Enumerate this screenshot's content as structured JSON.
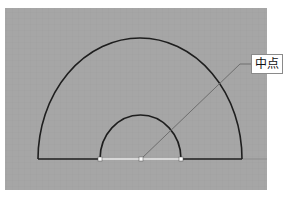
{
  "viewport": {
    "background": "#a6a6a6",
    "grid_color": "#9c9c9c",
    "left": 5,
    "top": 8,
    "right": 267,
    "bottom": 190
  },
  "shapes": {
    "outer_arc": {
      "cx": 140,
      "cy": 159,
      "rx": 102,
      "ry": 121,
      "color": "#1e1e1e"
    },
    "inner_arc": {
      "cx": 140.5,
      "cy": 159,
      "rx": 40.5,
      "ry": 44,
      "color": "#1e1e1e"
    },
    "baseline_left": {
      "x1": 38,
      "x2": 100,
      "y": 159
    },
    "baseline_right": {
      "x1": 181,
      "x2": 242,
      "y": 159
    },
    "highlighted_segment": {
      "x1": 100,
      "x2": 181,
      "y": 159,
      "color": "#e8e8e8"
    },
    "extension_line": {
      "x1": 242,
      "x2": 267,
      "y": 159,
      "color": "#8c8c8c"
    },
    "grips": [
      {
        "name": "left-endpoint",
        "x": 100,
        "y": 159
      },
      {
        "name": "midpoint",
        "x": 141,
        "y": 159
      },
      {
        "name": "right-endpoint",
        "x": 181,
        "y": 159
      }
    ],
    "leader": {
      "points": [
        [
          141,
          159
        ],
        [
          240,
          64
        ],
        [
          251,
          64
        ]
      ],
      "color": "#6e6e6e"
    }
  },
  "snap_tooltip": {
    "label": "中点"
  }
}
